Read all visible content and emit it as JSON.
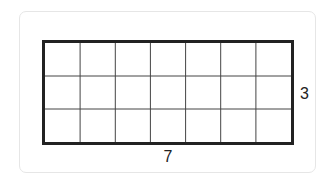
{
  "diagram": {
    "type": "rectangle-grid",
    "columns": 7,
    "rows": 3,
    "width_label": "7",
    "height_label": "3",
    "colors": {
      "outline": "#222222",
      "gridline": "#444444",
      "card_border": "#e6e6e6"
    }
  }
}
